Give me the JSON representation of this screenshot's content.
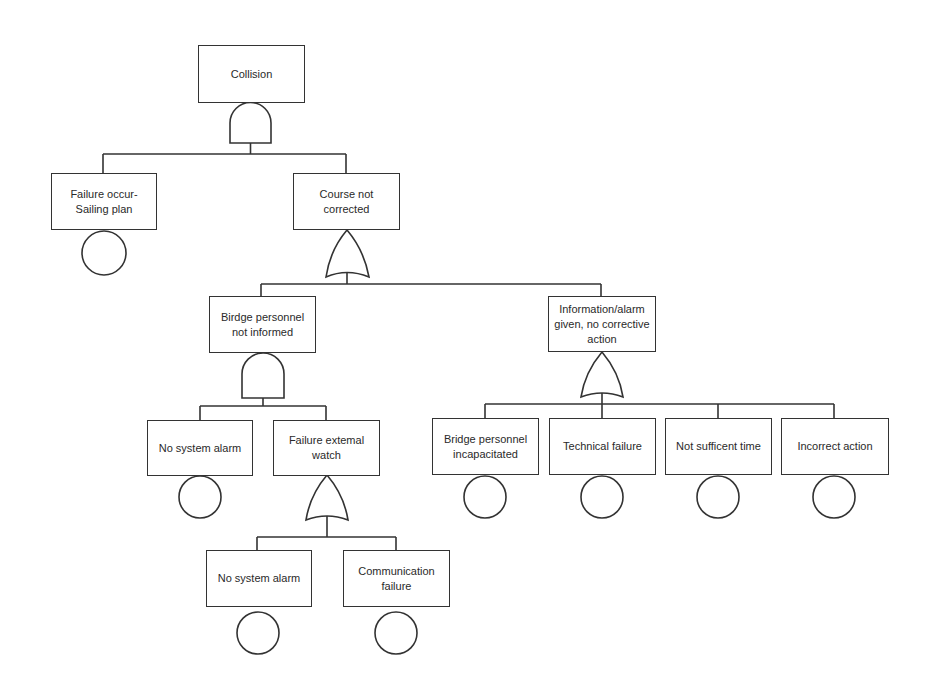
{
  "diagram": {
    "type": "fault-tree",
    "colors": {
      "line": "#333333",
      "text": "#2a2a2a",
      "background": "#ffffff"
    },
    "top_event": {
      "label": "Collision",
      "gate": "AND"
    },
    "nodes": {
      "collision": {
        "label": "Collision",
        "gate": "AND"
      },
      "failure_sailing_plan": {
        "label": "Failure occur-\nSailing plan",
        "type": "basic-event"
      },
      "course_not_corrected": {
        "label": "Course not\ncorrected",
        "gate": "OR"
      },
      "bridge_not_informed": {
        "label": "Birdge personnel\nnot informed",
        "gate": "AND"
      },
      "info_no_action": {
        "label": "Information/alarm\ngiven, no corrective\naction",
        "gate": "OR"
      },
      "no_system_alarm_1": {
        "label": "No system alarm",
        "type": "basic-event"
      },
      "failure_external_watch": {
        "label": "Failure extemal\nwatch",
        "gate": "OR"
      },
      "no_system_alarm_2": {
        "label": "No system alarm",
        "type": "basic-event"
      },
      "communication_failure": {
        "label": "Communication\nfailure",
        "type": "basic-event"
      },
      "bridge_incapacitated": {
        "label": "Bridge personnel\nincapacitated",
        "type": "basic-event"
      },
      "technical_failure": {
        "label": "Technical failure",
        "type": "basic-event"
      },
      "not_sufficient_time": {
        "label": "Not sufficent time",
        "type": "basic-event"
      },
      "incorrect_action": {
        "label": "Incorrect action",
        "type": "basic-event"
      }
    },
    "edges": [
      [
        "collision",
        "failure_sailing_plan"
      ],
      [
        "collision",
        "course_not_corrected"
      ],
      [
        "course_not_corrected",
        "bridge_not_informed"
      ],
      [
        "course_not_corrected",
        "info_no_action"
      ],
      [
        "bridge_not_informed",
        "no_system_alarm_1"
      ],
      [
        "bridge_not_informed",
        "failure_external_watch"
      ],
      [
        "failure_external_watch",
        "no_system_alarm_2"
      ],
      [
        "failure_external_watch",
        "communication_failure"
      ],
      [
        "info_no_action",
        "bridge_incapacitated"
      ],
      [
        "info_no_action",
        "technical_failure"
      ],
      [
        "info_no_action",
        "not_sufficient_time"
      ],
      [
        "info_no_action",
        "incorrect_action"
      ]
    ]
  }
}
